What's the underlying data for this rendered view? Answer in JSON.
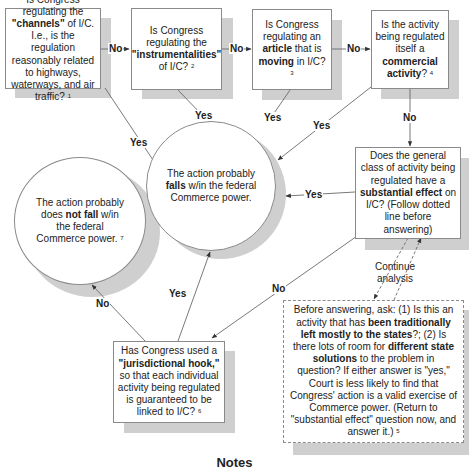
{
  "nodes": {
    "channels": {
      "pre": "Is Congress regulating the ",
      "bold": "\"channels\"",
      "post": " of I/C. I.e., is the regulation reasonably related to highways, waterways, and air traffic?",
      "note": "1"
    },
    "instrumentalities": {
      "pre": "Is Congress regulating the ",
      "bold": "\"instrumentalities\"",
      "post": " of I/C?",
      "note": "2"
    },
    "article": {
      "pre": "Is Congress regulating an ",
      "bold1": "article",
      "mid": " that is ",
      "bold2": "moving",
      "post": " in I/C?",
      "note": "3"
    },
    "commercial": {
      "pre": "Is the activity being regulated itself a ",
      "bold": "commercial activity",
      "post": "?",
      "note": "4"
    },
    "substantial": {
      "pre": "Does the general class of activity being regulated have a ",
      "bold": "substantial effect",
      "post": " on I/C? (Follow dotted line before answering)"
    },
    "before_answering": {
      "t1": "Before answering, ask: (1) Is this an activity that has ",
      "b1": "been traditionally left mostly to the states",
      "t2": "?; (2) Is there lots of room for ",
      "b2": "different state solutions",
      "t3": " to the problem in question? If either answer is \"yes,\" Court is less likely to find that Congress' action is a valid exercise of Commerce power. (Return to \"substantial effect\" question now, and answer it.)",
      "note": "5"
    },
    "jurisdictional": {
      "pre": "Has Congress used a ",
      "bold": "\"jurisdictional hook,\"",
      "post": " so that each individual activity being regulated is guaranteed to be linked to I/C?",
      "note": "6"
    },
    "falls": {
      "pre": "The action probably ",
      "bold": "falls",
      "post": " w/in the federal Commerce power."
    },
    "not_fall": {
      "pre": "The action probably does ",
      "bold": "not fall",
      "post": " w/in the federal Commerce power.",
      "note": "7"
    }
  },
  "edge_labels": {
    "no": "No",
    "yes": "Yes",
    "continue": "Continue analysis"
  },
  "footer": {
    "notes_heading": "Notes"
  },
  "colors": {
    "line": "#6a6a6a",
    "shadow": "#cfcfcf",
    "border": "#8a8a8a"
  }
}
